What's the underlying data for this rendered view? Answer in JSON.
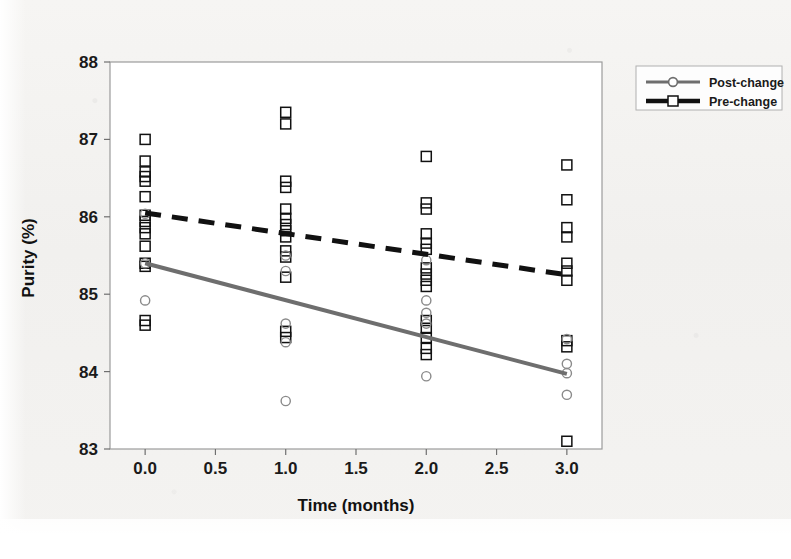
{
  "figure": {
    "background_color": "#f3f2f0",
    "plot_background_color": "#ffffff",
    "frame_color": "#9b9b9b"
  },
  "colors": {
    "pre_change": "#111111",
    "post_change": "#6e6e6e",
    "axis_text": "#1a1a1a",
    "legend_border": "#b0b0b0"
  },
  "legend": {
    "position": "top-right",
    "entries": [
      {
        "label": "Post-change",
        "marker": "circle-open",
        "line": "solid",
        "color": "#6e6e6e"
      },
      {
        "label": "Pre-change",
        "marker": "square-open",
        "line": "dashed",
        "color": "#111111"
      }
    ]
  },
  "chart_data": {
    "type": "scatter",
    "title": "",
    "subtitle": "",
    "xlabel": "Time (months)",
    "ylabel": "Purity (%)",
    "xlim": [
      -0.25,
      3.25
    ],
    "ylim": [
      83.0,
      88.0
    ],
    "xticks": [
      "0.0",
      "0.5",
      "1.0",
      "1.5",
      "2.0",
      "2.5",
      "3.0"
    ],
    "xtick_values": [
      0.0,
      0.5,
      1.0,
      1.5,
      2.0,
      2.5,
      3.0
    ],
    "yticks": [
      "83",
      "84",
      "85",
      "86",
      "87",
      "88"
    ],
    "ytick_values": [
      83,
      84,
      85,
      86,
      87,
      88
    ],
    "grid": false,
    "legend_position": "top-right outside",
    "series": [
      {
        "name": "Pre-change",
        "marker": "square-open",
        "color": "#111111",
        "trendline": {
          "style": "dashed",
          "x": [
            0.0,
            3.0
          ],
          "y": [
            86.05,
            85.25
          ]
        },
        "points": [
          {
            "x": 0.0,
            "y": 87.0
          },
          {
            "x": 0.0,
            "y": 86.72
          },
          {
            "x": 0.0,
            "y": 86.58
          },
          {
            "x": 0.0,
            "y": 86.52
          },
          {
            "x": 0.0,
            "y": 86.46
          },
          {
            "x": 0.0,
            "y": 86.26
          },
          {
            "x": 0.0,
            "y": 86.02
          },
          {
            "x": 0.0,
            "y": 85.94
          },
          {
            "x": 0.0,
            "y": 85.86
          },
          {
            "x": 0.0,
            "y": 85.78
          },
          {
            "x": 0.0,
            "y": 85.62
          },
          {
            "x": 0.0,
            "y": 85.4
          },
          {
            "x": 0.0,
            "y": 85.36
          },
          {
            "x": 0.0,
            "y": 84.66
          },
          {
            "x": 0.0,
            "y": 84.6
          },
          {
            "x": 1.0,
            "y": 87.35
          },
          {
            "x": 1.0,
            "y": 87.2
          },
          {
            "x": 1.0,
            "y": 86.46
          },
          {
            "x": 1.0,
            "y": 86.38
          },
          {
            "x": 1.0,
            "y": 86.1
          },
          {
            "x": 1.0,
            "y": 85.98
          },
          {
            "x": 1.0,
            "y": 85.9
          },
          {
            "x": 1.0,
            "y": 85.82
          },
          {
            "x": 1.0,
            "y": 85.74
          },
          {
            "x": 1.0,
            "y": 85.56
          },
          {
            "x": 1.0,
            "y": 85.48
          },
          {
            "x": 1.0,
            "y": 85.22
          },
          {
            "x": 1.0,
            "y": 84.52
          },
          {
            "x": 1.0,
            "y": 84.44
          },
          {
            "x": 2.0,
            "y": 86.78
          },
          {
            "x": 2.0,
            "y": 86.18
          },
          {
            "x": 2.0,
            "y": 86.1
          },
          {
            "x": 2.0,
            "y": 85.78
          },
          {
            "x": 2.0,
            "y": 85.66
          },
          {
            "x": 2.0,
            "y": 85.58
          },
          {
            "x": 2.0,
            "y": 85.34
          },
          {
            "x": 2.0,
            "y": 85.26
          },
          {
            "x": 2.0,
            "y": 85.18
          },
          {
            "x": 2.0,
            "y": 85.1
          },
          {
            "x": 2.0,
            "y": 84.66
          },
          {
            "x": 2.0,
            "y": 84.56
          },
          {
            "x": 2.0,
            "y": 84.44
          },
          {
            "x": 2.0,
            "y": 84.3
          },
          {
            "x": 2.0,
            "y": 84.22
          },
          {
            "x": 3.0,
            "y": 86.67
          },
          {
            "x": 3.0,
            "y": 86.22
          },
          {
            "x": 3.0,
            "y": 85.86
          },
          {
            "x": 3.0,
            "y": 85.74
          },
          {
            "x": 3.0,
            "y": 85.4
          },
          {
            "x": 3.0,
            "y": 85.3
          },
          {
            "x": 3.0,
            "y": 85.18
          },
          {
            "x": 3.0,
            "y": 84.4
          },
          {
            "x": 3.0,
            "y": 84.32
          },
          {
            "x": 3.0,
            "y": 83.1
          }
        ]
      },
      {
        "name": "Post-change",
        "marker": "circle-open",
        "color": "#8a8a8a",
        "trendline": {
          "style": "solid",
          "x": [
            0.0,
            3.0
          ],
          "y": [
            85.4,
            83.97
          ]
        },
        "points": [
          {
            "x": 0.0,
            "y": 86.04
          },
          {
            "x": 0.0,
            "y": 85.4
          },
          {
            "x": 0.0,
            "y": 84.92
          },
          {
            "x": 1.0,
            "y": 85.5
          },
          {
            "x": 1.0,
            "y": 85.3
          },
          {
            "x": 1.0,
            "y": 84.62
          },
          {
            "x": 1.0,
            "y": 84.38
          },
          {
            "x": 1.0,
            "y": 83.62
          },
          {
            "x": 2.0,
            "y": 85.44
          },
          {
            "x": 2.0,
            "y": 84.92
          },
          {
            "x": 2.0,
            "y": 84.76
          },
          {
            "x": 2.0,
            "y": 84.62
          },
          {
            "x": 2.0,
            "y": 83.94
          },
          {
            "x": 3.0,
            "y": 84.42
          },
          {
            "x": 3.0,
            "y": 84.1
          },
          {
            "x": 3.0,
            "y": 83.98
          },
          {
            "x": 3.0,
            "y": 83.7
          }
        ]
      }
    ]
  }
}
